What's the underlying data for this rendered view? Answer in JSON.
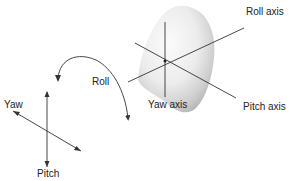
{
  "diagram": {
    "type": "aircraft rotation axes",
    "cone": {
      "labels": {
        "roll_axis": "Roll axis",
        "yaw_axis": "Yaw axis",
        "pitch_axis": "Pitch axis"
      }
    },
    "rotation": {
      "roll_label": "Roll"
    },
    "small_axes": {
      "yaw_label": "Yaw",
      "pitch_label": "Pitch"
    },
    "colors": {
      "line": "#333333",
      "cone_light": "#f4f4f4",
      "cone_shadow": "#bdbdbd",
      "background": "#ffffff"
    }
  }
}
